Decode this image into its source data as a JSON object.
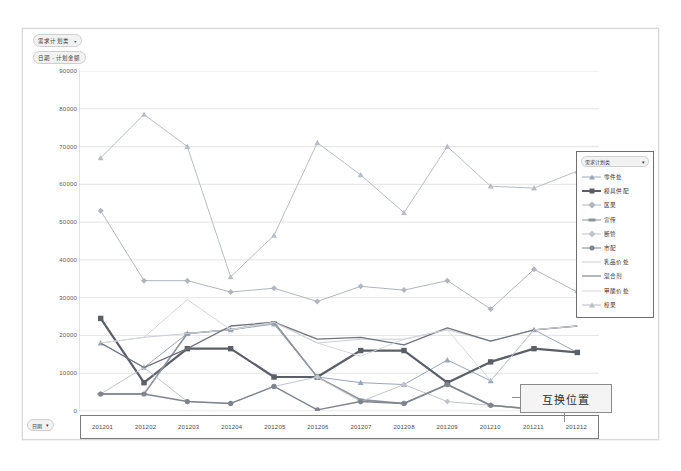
{
  "window": {
    "background_color": "#ffffff",
    "chart_frame_border": "#d8d8d8"
  },
  "filters": {
    "series_filter_label": "需求计划类",
    "axis_filter_label": "日期 - 计划金额",
    "bottom_left_label": "日期",
    "caret_glyph": "▾"
  },
  "legend": {
    "filter_label": "需求计划类",
    "caret_glyph": "▾",
    "items": [
      {
        "label": "零件处",
        "color": "#9aa7b8",
        "marker": "triangle",
        "width": 1
      },
      {
        "label": "模具供配",
        "color": "#5a5f68",
        "marker": "square",
        "width": 2.2
      },
      {
        "label": "区果",
        "color": "#b0b6bd",
        "marker": "diamond",
        "width": 1
      },
      {
        "label": "宣传",
        "color": "#8e949b",
        "marker": "bar",
        "width": 1.6
      },
      {
        "label": "断管",
        "color": "#c0c5cb",
        "marker": "diamond",
        "width": 1
      },
      {
        "label": "市配",
        "color": "#7f858d",
        "marker": "circle",
        "width": 1.4
      },
      {
        "label": "乳品价处",
        "color": "#c9ced4",
        "marker": "none",
        "width": 1
      },
      {
        "label": "混合剂",
        "color": "#6e747b",
        "marker": "none",
        "width": 1.3
      },
      {
        "label": "甲酸价处",
        "color": "#d3d7dc",
        "marker": "none",
        "width": 1
      },
      {
        "label": "樟果",
        "color": "#b8bec5",
        "marker": "triangle",
        "width": 1
      }
    ]
  },
  "callout": {
    "text": "互换位置"
  },
  "chart_data": {
    "type": "line",
    "title": "",
    "xlabel": "",
    "ylabel": "",
    "ylim": [
      0,
      90000
    ],
    "ytick_step": 10000,
    "yticks": [
      0,
      10000,
      20000,
      30000,
      40000,
      50000,
      60000,
      70000,
      80000,
      90000
    ],
    "ytick_labels": [
      "0",
      "10000",
      "20000",
      "30000",
      "40000",
      "50000",
      "60000",
      "70000",
      "80000",
      "90000"
    ],
    "grid": true,
    "grid_color": "#d9d9d9",
    "legend_position": "right",
    "categories": [
      "201201",
      "201202",
      "201203",
      "201204",
      "201205",
      "201206",
      "201207",
      "201208",
      "201209",
      "201210",
      "201211",
      "201212"
    ],
    "series": [
      {
        "name": "零件处",
        "color": "#9aa7b8",
        "marker": "triangle",
        "width": 1,
        "values": [
          18000,
          11500,
          20500,
          21500,
          23000,
          9000,
          7500,
          7000,
          13500,
          8000,
          21500,
          15500
        ]
      },
      {
        "name": "模具供配",
        "color": "#5a5f68",
        "marker": "square",
        "width": 2.2,
        "values": [
          24500,
          7500,
          16500,
          16500,
          9000,
          9000,
          16000,
          16000,
          7500,
          13000,
          16500,
          15500
        ]
      },
      {
        "name": "区果",
        "color": "#b0b6bd",
        "marker": "diamond",
        "width": 1,
        "values": [
          53000,
          34500,
          34500,
          31500,
          32500,
          29000,
          33000,
          32000,
          34500,
          27000,
          37500,
          31500
        ]
      },
      {
        "name": "宣传",
        "color": "#8e949b",
        "marker": "bar",
        "width": 1.6,
        "values": [
          4500,
          4500,
          20500,
          21500,
          23500,
          9000,
          3000,
          2000,
          7000,
          1500,
          500,
          500
        ]
      },
      {
        "name": "断管",
        "color": "#c0c5cb",
        "marker": "diamond",
        "width": 1,
        "values": [
          4500,
          11500,
          2500,
          2000,
          6500,
          9000,
          2500,
          7000,
          2500,
          1500,
          500,
          500
        ]
      },
      {
        "name": "市配",
        "color": "#7f858d",
        "marker": "circle",
        "width": 1.4,
        "values": [
          4500,
          4500,
          2500,
          2000,
          6500,
          300,
          2500,
          2000,
          7000,
          1500,
          500,
          500
        ]
      },
      {
        "name": "乳品价处",
        "color": "#c9ced4",
        "marker": "none",
        "width": 1,
        "values": [
          18000,
          19500,
          20500,
          21500,
          23500,
          18000,
          19000,
          19000,
          21500,
          18500,
          21500,
          22500
        ]
      },
      {
        "name": "混合剂",
        "color": "#6e747b",
        "marker": "none",
        "width": 1.3,
        "values": [
          18000,
          11500,
          16500,
          22500,
          23500,
          19000,
          19500,
          17500,
          22000,
          18500,
          21500,
          22500
        ]
      },
      {
        "name": "甲酸价处",
        "color": "#d3d7dc",
        "marker": "none",
        "width": 1,
        "values": [
          18000,
          19500,
          29500,
          21500,
          23500,
          18000,
          14500,
          19000,
          21500,
          8000,
          21500,
          22500
        ]
      },
      {
        "name": "樟果",
        "color": "#b8bec5",
        "marker": "triangle",
        "width": 1,
        "values": [
          67000,
          78500,
          70000,
          35500,
          46500,
          71000,
          62500,
          52500,
          70000,
          59500,
          59000,
          63500
        ]
      }
    ]
  }
}
